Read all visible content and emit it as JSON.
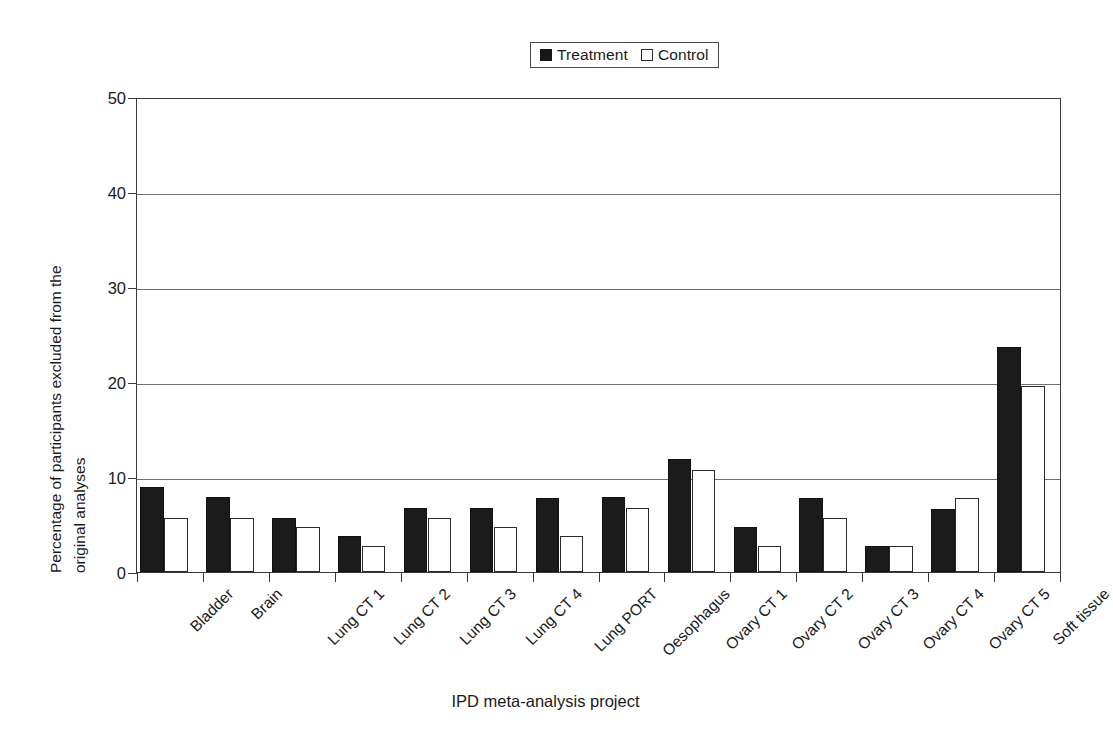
{
  "chart_data": {
    "type": "bar",
    "title": "",
    "xlabel": "IPD meta-analysis project",
    "ylabel": "Percentage of participants excluded from the\noriginal analyses",
    "ylim": [
      0,
      50
    ],
    "yticks": [
      0,
      10,
      20,
      30,
      40,
      50
    ],
    "ytick_labels": [
      "0",
      "10",
      "20",
      "30",
      "40",
      "50"
    ],
    "grid": "horizontal",
    "legend_position": "top-center",
    "categories": [
      "Bladder",
      "Brain",
      "Lung CT 1",
      "Lung CT 2",
      "Lung CT 3",
      "Lung CT 4",
      "Lung PORT",
      "Oesophagus",
      "Ovary CT 1",
      "Ovary CT 2",
      "Ovary CT 3",
      "Ovary CT 4",
      "Ovary CT 5",
      "Soft tissue"
    ],
    "series": [
      {
        "name": "Treatment",
        "color": "#1b1b1b",
        "style": "filled",
        "values": [
          9.0,
          7.9,
          5.7,
          3.8,
          6.8,
          6.8,
          7.8,
          7.9,
          11.9,
          4.8,
          7.8,
          2.7,
          6.7,
          23.8
        ]
      },
      {
        "name": "Control",
        "color": "#ffffff",
        "style": "outlined",
        "values": [
          5.7,
          5.7,
          4.8,
          2.7,
          5.7,
          4.8,
          3.8,
          6.8,
          10.8,
          2.7,
          5.7,
          2.7,
          7.8,
          19.7
        ]
      }
    ]
  },
  "legend": {
    "entries": [
      {
        "label": "Treatment",
        "swatch": "filled-square-icon"
      },
      {
        "label": "Control",
        "swatch": "open-square-icon"
      }
    ]
  },
  "axes": {
    "y_title": "Percentage of participants excluded from the\noriginal analyses",
    "x_title": "IPD meta-analysis project"
  }
}
